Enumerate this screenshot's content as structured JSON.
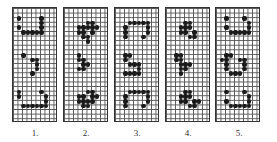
{
  "figure": {
    "grid": {
      "cols": 10,
      "rows": 25,
      "cell_w": 4.5,
      "cell_h": 4.6
    },
    "colors": {
      "dot": "#1a1a1a",
      "grid_line": "#555555",
      "background": "#ffffff"
    },
    "panels": [
      {
        "label": "1.",
        "left": 12,
        "dots": [
          [
            1,
            2
          ],
          [
            6,
            2
          ],
          [
            1,
            4
          ],
          [
            6,
            3
          ],
          [
            6,
            4
          ],
          [
            2,
            5
          ],
          [
            3,
            5
          ],
          [
            4,
            5
          ],
          [
            5,
            5
          ],
          [
            6,
            5
          ],
          [
            2,
            10
          ],
          [
            4,
            11
          ],
          [
            5,
            11
          ],
          [
            5,
            12
          ],
          [
            5,
            13
          ],
          [
            4,
            14
          ],
          [
            1,
            18
          ],
          [
            6,
            18
          ],
          [
            1,
            19
          ],
          [
            7,
            19
          ],
          [
            7,
            20
          ],
          [
            2,
            21
          ],
          [
            3,
            21
          ],
          [
            4,
            21
          ],
          [
            5,
            21
          ],
          [
            6,
            21
          ],
          [
            7,
            21
          ]
        ]
      },
      {
        "label": "2.",
        "left": 63,
        "dots": [
          [
            5,
            3
          ],
          [
            6,
            3
          ],
          [
            3,
            4
          ],
          [
            4,
            4
          ],
          [
            5,
            4
          ],
          [
            6,
            4
          ],
          [
            7,
            4
          ],
          [
            3,
            5
          ],
          [
            4,
            5
          ],
          [
            6,
            5
          ],
          [
            4,
            6
          ],
          [
            5,
            6
          ],
          [
            5,
            7
          ],
          [
            3,
            10
          ],
          [
            3,
            11
          ],
          [
            4,
            11
          ],
          [
            4,
            12
          ],
          [
            5,
            12
          ],
          [
            3,
            13
          ],
          [
            4,
            13
          ],
          [
            5,
            18
          ],
          [
            6,
            18
          ],
          [
            3,
            19
          ],
          [
            4,
            19
          ],
          [
            6,
            19
          ],
          [
            7,
            19
          ],
          [
            3,
            20
          ],
          [
            4,
            20
          ],
          [
            5,
            20
          ],
          [
            6,
            20
          ],
          [
            4,
            21
          ],
          [
            5,
            21
          ]
        ]
      },
      {
        "label": "3.",
        "left": 114,
        "dots": [
          [
            2,
            4
          ],
          [
            3,
            3
          ],
          [
            4,
            3
          ],
          [
            5,
            3
          ],
          [
            6,
            3
          ],
          [
            7,
            3
          ],
          [
            7,
            4
          ],
          [
            7,
            5
          ],
          [
            2,
            5
          ],
          [
            6,
            6
          ],
          [
            2,
            6
          ],
          [
            2,
            10
          ],
          [
            3,
            10
          ],
          [
            2,
            11
          ],
          [
            3,
            12
          ],
          [
            4,
            12
          ],
          [
            5,
            12
          ],
          [
            5,
            13
          ],
          [
            2,
            14
          ],
          [
            3,
            14
          ],
          [
            4,
            14
          ],
          [
            5,
            14
          ],
          [
            3,
            18
          ],
          [
            4,
            18
          ],
          [
            5,
            18
          ],
          [
            6,
            18
          ],
          [
            7,
            18
          ],
          [
            2,
            19
          ],
          [
            7,
            19
          ],
          [
            2,
            20
          ],
          [
            7,
            20
          ],
          [
            2,
            21
          ],
          [
            6,
            21
          ]
        ]
      },
      {
        "label": "4.",
        "left": 165,
        "dots": [
          [
            4,
            3
          ],
          [
            5,
            3
          ],
          [
            3,
            4
          ],
          [
            4,
            4
          ],
          [
            5,
            4
          ],
          [
            3,
            5
          ],
          [
            4,
            5
          ],
          [
            6,
            5
          ],
          [
            5,
            6
          ],
          [
            6,
            6
          ],
          [
            2,
            10
          ],
          [
            3,
            10
          ],
          [
            2,
            11
          ],
          [
            3,
            11
          ],
          [
            3,
            12
          ],
          [
            4,
            12
          ],
          [
            5,
            12
          ],
          [
            3,
            13
          ],
          [
            4,
            13
          ],
          [
            3,
            14
          ],
          [
            4,
            18
          ],
          [
            5,
            18
          ],
          [
            3,
            19
          ],
          [
            4,
            19
          ],
          [
            5,
            19
          ],
          [
            3,
            20
          ],
          [
            4,
            20
          ],
          [
            6,
            20
          ],
          [
            5,
            21
          ],
          [
            6,
            21
          ],
          [
            7,
            20
          ]
        ]
      },
      {
        "label": "5.",
        "left": 215,
        "dots": [
          [
            2,
            2
          ],
          [
            6,
            2
          ],
          [
            2,
            4
          ],
          [
            7,
            3
          ],
          [
            7,
            4
          ],
          [
            3,
            5
          ],
          [
            4,
            5
          ],
          [
            5,
            5
          ],
          [
            6,
            5
          ],
          [
            7,
            5
          ],
          [
            2,
            10
          ],
          [
            3,
            10
          ],
          [
            1,
            11
          ],
          [
            2,
            11
          ],
          [
            5,
            11
          ],
          [
            6,
            11
          ],
          [
            2,
            12
          ],
          [
            6,
            12
          ],
          [
            2,
            13
          ],
          [
            6,
            13
          ],
          [
            3,
            14
          ],
          [
            4,
            14
          ],
          [
            5,
            14
          ],
          [
            2,
            18
          ],
          [
            6,
            18
          ],
          [
            7,
            19
          ],
          [
            2,
            20
          ],
          [
            7,
            20
          ],
          [
            3,
            21
          ],
          [
            4,
            21
          ],
          [
            5,
            21
          ],
          [
            6,
            21
          ],
          [
            7,
            21
          ]
        ]
      }
    ]
  }
}
